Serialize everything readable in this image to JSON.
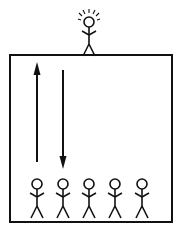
{
  "diagram": {
    "colors": {
      "stroke": "#111111",
      "background": "#ffffff"
    },
    "box": {
      "x": 10,
      "y": 55,
      "width": 162,
      "height": 167
    },
    "top_figure": {
      "cx": 89,
      "head_cy": 25,
      "feet_y": 55,
      "highlighted": true
    },
    "arrows": [
      {
        "direction": "up",
        "x": 37,
        "y1": 162,
        "y2": 63
      },
      {
        "direction": "down",
        "x": 63,
        "y1": 70,
        "y2": 168
      }
    ],
    "bottom_figures": [
      {
        "cx": 37
      },
      {
        "cx": 63
      },
      {
        "cx": 89
      },
      {
        "cx": 115
      },
      {
        "cx": 142
      }
    ]
  }
}
